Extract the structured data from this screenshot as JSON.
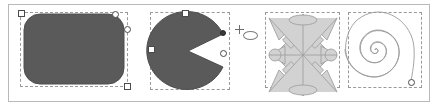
{
  "window": {
    "title": "Shape selection strip",
    "background_color": "#ffffff",
    "frame_border_color": "#b9b9b9"
  },
  "palette": {
    "dark_fill": "#5a5a5a",
    "dark_fill_stroke": "#4e4e4e",
    "light_fill": "#d2d2d2",
    "light_fill_stroke": "#a0a0a0",
    "outline_stroke": "#9a9a9a",
    "selection_dash": "#9a9a9a",
    "handle_fill": "#ffffff",
    "handle_stroke": "#4a4a4a",
    "handle_dark": "#3a3a3a"
  },
  "shapes": [
    {
      "id": "rounded-rectangle",
      "name": "Rounded rectangle",
      "kind": "rounded-rect",
      "fill": "#5a5a5a",
      "stroke": "#4e4e4e",
      "selected": true,
      "selection_box": {
        "x": 20,
        "y": 12,
        "width": 108,
        "height": 75
      },
      "handles": [
        {
          "type": "square",
          "position": "top-left",
          "x": 18,
          "y": 10
        },
        {
          "type": "circle",
          "position": "top-right",
          "x": 112,
          "y": 11
        },
        {
          "type": "circle",
          "position": "right-corner",
          "x": 124,
          "y": 26
        },
        {
          "type": "square",
          "position": "bottom-right",
          "x": 124,
          "y": 83
        }
      ]
    },
    {
      "id": "pac-wedge",
      "name": "Circle with wedge removed",
      "kind": "pac",
      "fill": "#5a5a5a",
      "stroke": "#4e4e4e",
      "selected": true,
      "selection_box": {
        "x": 150,
        "y": 12,
        "width": 80,
        "height": 78
      },
      "handles": [
        {
          "type": "square",
          "position": "top-center",
          "x": 182,
          "y": 10
        },
        {
          "type": "square",
          "position": "left-middle",
          "x": 148,
          "y": 46
        },
        {
          "type": "circle",
          "position": "wedge-lower",
          "x": 225,
          "y": 50
        },
        {
          "type": "dark",
          "position": "wedge-apex",
          "x": 219,
          "y": 30
        }
      ],
      "cursor": {
        "type": "crosshair",
        "x": 235,
        "y": 26
      },
      "ghost_ellipse": {
        "x": 243,
        "y": 31,
        "width": 15,
        "height": 9
      }
    },
    {
      "id": "kaleidoscope",
      "name": "Radially symmetric ornament",
      "kind": "kaleidoscope",
      "fill": "#d2d2d2",
      "stroke": "#a0a0a0",
      "selected": true,
      "selection_box": {
        "x": 265,
        "y": 12,
        "width": 75,
        "height": 76
      },
      "handles": []
    },
    {
      "id": "logarithmic-spiral",
      "name": "Logarithmic spiral",
      "kind": "spiral",
      "fill": "none",
      "stroke": "#9a9a9a",
      "selected": true,
      "selection_box": {
        "x": 348,
        "y": 12,
        "width": 74,
        "height": 76
      },
      "handles": [
        {
          "type": "circle",
          "position": "spiral-end",
          "x": 412,
          "y": 84
        }
      ]
    }
  ]
}
